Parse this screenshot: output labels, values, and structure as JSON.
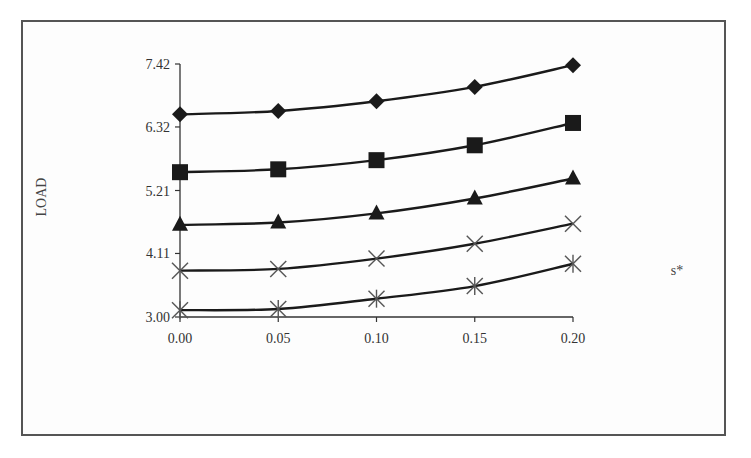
{
  "chart_data": {
    "type": "line",
    "title": "",
    "xlabel": "s*",
    "ylabel": "LOAD",
    "x": [
      0.0,
      0.05,
      0.1,
      0.15,
      0.2
    ],
    "x_tick_labels": [
      "0.00",
      "0.05",
      "0.10",
      "0.15",
      "0.20"
    ],
    "y_tick_labels": [
      "3.00",
      "4.11",
      "5.21",
      "6.32",
      "7.42"
    ],
    "y_ticks": [
      3.0,
      4.11,
      5.21,
      6.32,
      7.42
    ],
    "ylim": [
      3.0,
      7.42
    ],
    "xlim": [
      0.0,
      0.2
    ],
    "grid": false,
    "legend": "none",
    "series": [
      {
        "name": "series-diamond",
        "marker": "diamond",
        "values": [
          6.54,
          6.6,
          6.77,
          7.02,
          7.4
        ]
      },
      {
        "name": "series-square",
        "marker": "square",
        "values": [
          5.53,
          5.58,
          5.74,
          6.0,
          6.39
        ]
      },
      {
        "name": "series-triangle",
        "marker": "triangle",
        "values": [
          4.61,
          4.65,
          4.81,
          5.07,
          5.42
        ]
      },
      {
        "name": "series-x",
        "marker": "x",
        "values": [
          3.81,
          3.84,
          4.02,
          4.28,
          4.63
        ]
      },
      {
        "name": "series-asterisk",
        "marker": "asterisk",
        "values": [
          3.12,
          3.14,
          3.32,
          3.54,
          3.93
        ]
      }
    ]
  },
  "colors": {
    "line": "#1a1a1a",
    "marker_fill": "#1a1a1a",
    "cross_marker": "#555555",
    "axis": "#333333",
    "frame": "#555555"
  }
}
